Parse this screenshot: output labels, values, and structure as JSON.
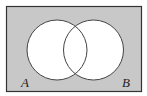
{
  "diagram": {
    "type": "venn",
    "universe": {
      "x": 6,
      "y": 6,
      "width": 136,
      "height": 86,
      "fill": "#c8c8c8",
      "stroke": "#333333"
    },
    "sets": [
      {
        "label": "A",
        "cx": 57,
        "cy": 50,
        "r": 30,
        "fill": "#ffffff",
        "label_x": 22,
        "label_y": 87
      },
      {
        "label": "B",
        "cx": 93.5,
        "cy": 50,
        "r": 30,
        "fill": "#ffffff",
        "label_x": 123,
        "label_y": 87
      }
    ],
    "shaded_region": "complement of A ∪ B"
  }
}
